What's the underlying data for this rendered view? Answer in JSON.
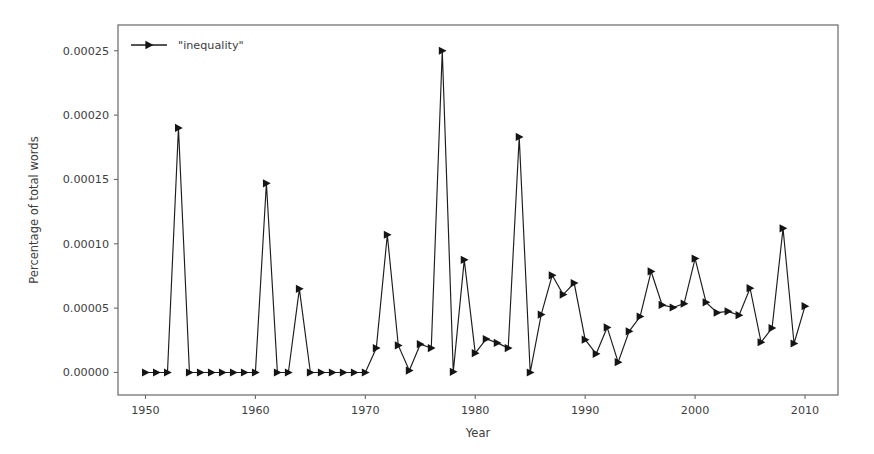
{
  "chart_data": {
    "type": "line",
    "title": "",
    "xlabel": "Year",
    "ylabel": "Percentage of total words",
    "xlim": [
      1947.5,
      2013.0
    ],
    "ylim": [
      -1.75e-05,
      0.00027
    ],
    "xticks": [
      1950,
      1960,
      1970,
      1980,
      1990,
      2000,
      2010
    ],
    "xticklabels": [
      "1950",
      "1960",
      "1970",
      "1980",
      "1990",
      "2000",
      "2010"
    ],
    "yticks": [
      0.0,
      5e-05,
      0.0001,
      0.00015,
      0.0002,
      0.00025
    ],
    "yticklabels": [
      "0.00000",
      "0.00005",
      "0.00010",
      "0.00015",
      "0.00020",
      "0.00025"
    ],
    "grid": false,
    "legend_position": "upper left",
    "legend": [
      "\"inequality\""
    ],
    "marker": "right-triangle",
    "line_color": "#1c1c1c",
    "series": [
      {
        "name": "\"inequality\"",
        "x": [
          1950,
          1951,
          1952,
          1953,
          1954,
          1955,
          1956,
          1957,
          1958,
          1959,
          1960,
          1961,
          1962,
          1963,
          1964,
          1965,
          1966,
          1967,
          1968,
          1969,
          1970,
          1971,
          1972,
          1973,
          1974,
          1975,
          1976,
          1977,
          1978,
          1979,
          1980,
          1981,
          1982,
          1983,
          1984,
          1985,
          1986,
          1987,
          1988,
          1989,
          1990,
          1991,
          1992,
          1993,
          1994,
          1995,
          1996,
          1997,
          1998,
          1999,
          2000,
          2001,
          2002,
          2003,
          2004,
          2005,
          2006,
          2007,
          2008,
          2009,
          2010
        ],
        "values": [
          0.0,
          0.0,
          0.0,
          0.00019,
          0.0,
          0.0,
          0.0,
          0.0,
          0.0,
          0.0,
          0.0,
          0.000147,
          0.0,
          0.0,
          6.5e-05,
          0.0,
          0.0,
          0.0,
          0.0,
          0.0,
          0.0,
          1.9e-05,
          0.000107,
          2.1e-05,
          1.5e-06,
          2.2e-05,
          1.9e-05,
          0.00025,
          5e-07,
          8.75e-05,
          1.5e-05,
          2.6e-05,
          2.3e-05,
          1.9e-05,
          0.000183,
          0.0,
          4.5e-05,
          7.55e-05,
          6.05e-05,
          6.95e-05,
          2.55e-05,
          1.45e-05,
          3.5e-05,
          8e-06,
          3.2e-05,
          4.35e-05,
          7.85e-05,
          5.25e-05,
          5.05e-05,
          5.35e-05,
          8.85e-05,
          5.45e-05,
          4.65e-05,
          4.75e-05,
          4.45e-05,
          6.55e-05,
          2.35e-05,
          3.45e-05,
          0.000112,
          2.25e-05,
          5.15e-05
        ]
      }
    ]
  },
  "axes": {
    "y_label": "Percentage of total words",
    "x_label": "Year"
  }
}
